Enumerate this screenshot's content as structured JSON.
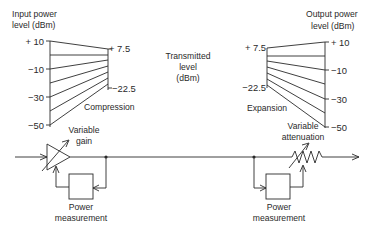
{
  "diagram": {
    "input_label": [
      "Input power",
      "level (dBm)"
    ],
    "output_label": [
      "Output power",
      "level (dBm)"
    ],
    "transmitted_label": [
      "Transmitted",
      "level",
      "(dBm)"
    ],
    "compression_label": "Compression",
    "expansion_label": "Expansion",
    "input_ticks": [
      "+ 10",
      "−10",
      "−30",
      "−50"
    ],
    "compressor_out_ticks": [
      "+ 7.5",
      "−22.5"
    ],
    "expander_in_ticks": [
      "+ 7.5",
      "−22.5"
    ],
    "output_ticks": [
      "+ 10",
      "−10",
      "−30",
      "−50"
    ],
    "variable_gain_label": [
      "Variable",
      "gain"
    ],
    "variable_attenuation_label": [
      "Variable",
      "attenuation"
    ],
    "power_measurement_left": [
      "Power",
      "measurement"
    ],
    "power_measurement_right": [
      "Power",
      "measurement"
    ],
    "colors": {
      "line": "#2a2a2a",
      "background": "#ffffff"
    }
  }
}
